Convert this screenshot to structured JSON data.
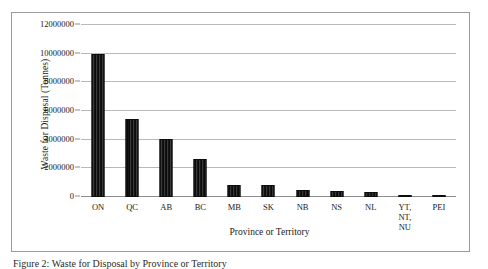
{
  "figure": {
    "caption": "Figure 2: Waste for Disposal by Province or Territory",
    "frame_color": "#9a9a9a"
  },
  "chart_data": {
    "type": "bar",
    "title": "",
    "xlabel": "Province or Territory",
    "ylabel": "Waste for Disposal (Tonnes)",
    "categories": [
      "ON",
      "QC",
      "AB",
      "BC",
      "MB",
      "SK",
      "NB",
      "NS",
      "NL",
      "YT, NT,\nNU",
      "PEI"
    ],
    "values": [
      10000000,
      5450000,
      4050000,
      2650000,
      850000,
      850000,
      500000,
      420000,
      380000,
      60000,
      40000
    ],
    "ylim": [
      0,
      12000000
    ],
    "ytick_values": [
      0,
      2000000,
      4000000,
      6000000,
      8000000,
      10000000,
      12000000
    ],
    "ytick_labels": [
      "0",
      "2000000",
      "4000000",
      "6000000",
      "8000000",
      "10000000",
      "12000000"
    ],
    "grid": "horizontal",
    "legend": "none",
    "bar_color": "#232323",
    "gridline_color": "#b9b9b9",
    "axis_color": "#8d8d8d"
  }
}
